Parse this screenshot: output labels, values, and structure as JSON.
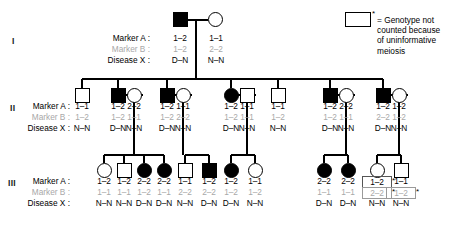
{
  "legend": {
    "star": "*",
    "equals": "=",
    "text": "Genotype not\ncounted because\nof uninformative\nmeiosis",
    "symbol_name": "empty-square"
  },
  "row_labels": {
    "marker_a": "Marker A :",
    "marker_b": "Marker B :",
    "disease_x": "Disease X :"
  },
  "generations": [
    {
      "id": "I",
      "label": "I",
      "individuals": [
        {
          "shape": "square",
          "affected": true,
          "marker_a": "1–2",
          "marker_b": "1–2",
          "disease_x": "D–N",
          "boxed_a": false,
          "boxed_b": false,
          "star_a": false,
          "star_b": false
        },
        {
          "shape": "circle",
          "affected": false,
          "marker_a": "1–1",
          "marker_b": "2–2",
          "disease_x": "N–N",
          "boxed_a": false,
          "boxed_b": false,
          "star_a": false,
          "star_b": false
        }
      ]
    },
    {
      "id": "II",
      "label": "II",
      "individuals": [
        {
          "shape": "square",
          "affected": false,
          "marker_a": "1–1",
          "marker_b": "1–2",
          "disease_x": "N–N",
          "boxed_a": false,
          "boxed_b": false,
          "star_a": false,
          "star_b": false
        },
        {
          "shape": "square",
          "affected": true,
          "marker_a": "1–2",
          "marker_b": "1–2",
          "disease_x": "D–N",
          "boxed_a": false,
          "boxed_b": false,
          "star_a": false,
          "star_b": false
        },
        {
          "shape": "circle",
          "affected": false,
          "marker_a": "2–2",
          "marker_b": "1–1",
          "disease_x": "N–N",
          "boxed_a": false,
          "boxed_b": false,
          "star_a": false,
          "star_b": false
        },
        {
          "shape": "square",
          "affected": true,
          "marker_a": "1–2",
          "marker_b": "1–2",
          "disease_x": "D–N",
          "boxed_a": false,
          "boxed_b": false,
          "star_a": false,
          "star_b": false
        },
        {
          "shape": "circle",
          "affected": false,
          "marker_a": "1–1",
          "marker_b": "2–2",
          "disease_x": "N–N",
          "boxed_a": false,
          "boxed_b": false,
          "star_a": false,
          "star_b": false
        },
        {
          "shape": "circle",
          "affected": true,
          "marker_a": "1–2",
          "marker_b": "1–2",
          "disease_x": "D–N",
          "boxed_a": false,
          "boxed_b": false,
          "star_a": false,
          "star_b": false
        },
        {
          "shape": "square",
          "affected": false,
          "marker_a": "1–1",
          "marker_b": "1–1",
          "disease_x": "N–N",
          "boxed_a": false,
          "boxed_b": false,
          "star_a": false,
          "star_b": false
        },
        {
          "shape": "square",
          "affected": false,
          "marker_a": "1–1",
          "marker_b": "1–2",
          "disease_x": "N–N",
          "boxed_a": false,
          "boxed_b": false,
          "star_a": false,
          "star_b": false
        },
        {
          "shape": "square",
          "affected": true,
          "marker_a": "1–2",
          "marker_b": "1–2",
          "disease_x": "D–N",
          "boxed_a": false,
          "boxed_b": false,
          "star_a": false,
          "star_b": false
        },
        {
          "shape": "circle",
          "affected": false,
          "marker_a": "2–2",
          "marker_b": "1–1",
          "disease_x": "N–N",
          "boxed_a": false,
          "boxed_b": false,
          "star_a": false,
          "star_b": false
        },
        {
          "shape": "square",
          "affected": true,
          "marker_a": "1–2",
          "marker_b": "2–2",
          "disease_x": "D–N",
          "boxed_a": false,
          "boxed_b": false,
          "star_a": false,
          "star_b": false
        },
        {
          "shape": "circle",
          "affected": false,
          "marker_a": "1–2",
          "marker_b": "1–2",
          "disease_x": "N–N",
          "boxed_a": false,
          "boxed_b": false,
          "star_a": false,
          "star_b": false
        }
      ]
    },
    {
      "id": "III",
      "label": "III",
      "individuals": [
        {
          "shape": "circle",
          "affected": false,
          "marker_a": "1–2",
          "marker_b": "1–1",
          "disease_x": "N–N",
          "boxed_a": false,
          "boxed_b": false,
          "star_a": false,
          "star_b": false
        },
        {
          "shape": "square",
          "affected": false,
          "marker_a": "1–2",
          "marker_b": "1–1",
          "disease_x": "N–N",
          "boxed_a": false,
          "boxed_b": false,
          "star_a": false,
          "star_b": false
        },
        {
          "shape": "circle",
          "affected": true,
          "marker_a": "2–2",
          "marker_b": "1–2",
          "disease_x": "D–N",
          "boxed_a": false,
          "boxed_b": false,
          "star_a": false,
          "star_b": false
        },
        {
          "shape": "circle",
          "affected": true,
          "marker_a": "2–2",
          "marker_b": "1–1",
          "disease_x": "D–N",
          "boxed_a": false,
          "boxed_b": false,
          "star_a": false,
          "star_b": false
        },
        {
          "shape": "square",
          "affected": false,
          "marker_a": "1–1",
          "marker_b": "2–2",
          "disease_x": "N–N",
          "boxed_a": false,
          "boxed_b": false,
          "star_a": false,
          "star_b": false
        },
        {
          "shape": "square",
          "affected": true,
          "marker_a": "1–2",
          "marker_b": "2–2",
          "disease_x": "D–N",
          "boxed_a": false,
          "boxed_b": false,
          "star_a": false,
          "star_b": false
        },
        {
          "shape": "circle",
          "affected": true,
          "marker_a": "1–2",
          "marker_b": "1–2",
          "disease_x": "D–N",
          "boxed_a": false,
          "boxed_b": false,
          "star_a": false,
          "star_b": false
        },
        {
          "shape": "circle",
          "affected": false,
          "marker_a": "1–1",
          "marker_b": "1–2",
          "disease_x": "N–N",
          "boxed_a": false,
          "boxed_b": false,
          "star_a": false,
          "star_b": false
        },
        {
          "shape": "circle",
          "affected": true,
          "marker_a": "2–2",
          "marker_b": "1–1",
          "disease_x": "D–N",
          "boxed_a": false,
          "boxed_b": false,
          "star_a": false,
          "star_b": false
        },
        {
          "shape": "circle",
          "affected": true,
          "marker_a": "2–2",
          "marker_b": "1–1",
          "disease_x": "D–N",
          "boxed_a": false,
          "boxed_b": false,
          "star_a": false,
          "star_b": false
        },
        {
          "shape": "circle",
          "affected": false,
          "marker_a": "1–2",
          "marker_b": "2–2",
          "disease_x": "N–N",
          "boxed_a": true,
          "boxed_b": true,
          "star_a": true,
          "star_b": true
        },
        {
          "shape": "square",
          "affected": false,
          "marker_a": "1–1",
          "marker_b": "1–2",
          "disease_x": "N–N",
          "boxed_a": false,
          "boxed_b": true,
          "star_a": false,
          "star_b": true
        }
      ]
    }
  ]
}
